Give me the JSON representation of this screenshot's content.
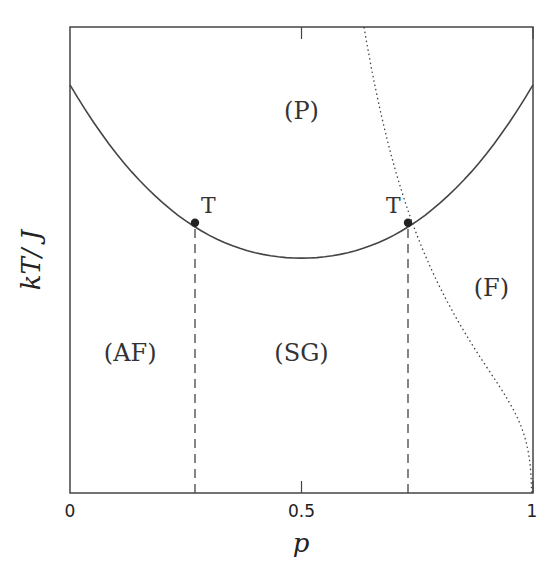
{
  "chart_data": {
    "type": "line",
    "title": "",
    "xlabel": "p",
    "ylabel": "kT/ J",
    "xlim": [
      0,
      1
    ],
    "ylim": [
      0,
      1
    ],
    "x_ticks": [
      {
        "value": 0,
        "label": "0"
      },
      {
        "value": 0.5,
        "label": "0.5"
      },
      {
        "value": 1,
        "label": "1"
      }
    ],
    "y_ticks": [],
    "grid": false,
    "legend": null,
    "series": [
      {
        "name": "para-ordered phase boundary",
        "style": "solid",
        "x": [
          0,
          0.1,
          0.2,
          0.27,
          0.35,
          0.4,
          0.5,
          0.6,
          0.65,
          0.73,
          0.8,
          0.9,
          1
        ],
        "y": [
          0.876,
          0.74,
          0.625,
          0.58,
          0.54,
          0.52,
          0.504,
          0.52,
          0.54,
          0.58,
          0.625,
          0.74,
          0.876
        ]
      },
      {
        "name": "Nishimori line",
        "style": "dotted",
        "x": [
          0.635,
          0.68,
          0.73,
          0.8,
          0.88,
          0.94,
          0.98,
          0.995,
          1
        ],
        "y": [
          1.0,
          0.8,
          0.585,
          0.4,
          0.28,
          0.2,
          0.14,
          0.08,
          0.0
        ]
      },
      {
        "name": "AF-SG boundary",
        "style": "dashed",
        "x": [
          0.27,
          0.27
        ],
        "y": [
          0,
          0.58
        ]
      },
      {
        "name": "SG-F boundary",
        "style": "dashed",
        "x": [
          0.73,
          0.73
        ],
        "y": [
          0,
          0.58
        ]
      }
    ],
    "points": [
      {
        "label": "T",
        "x": 0.27,
        "y": 0.58
      },
      {
        "label": "T",
        "x": 0.73,
        "y": 0.58
      }
    ],
    "annotations": [
      {
        "text": "(P)",
        "x": 0.5,
        "y": 0.82
      },
      {
        "text": "(AF)",
        "x": 0.13,
        "y": 0.3
      },
      {
        "text": "(SG)",
        "x": 0.5,
        "y": 0.3
      },
      {
        "text": "(F)",
        "x": 0.91,
        "y": 0.44
      }
    ]
  }
}
